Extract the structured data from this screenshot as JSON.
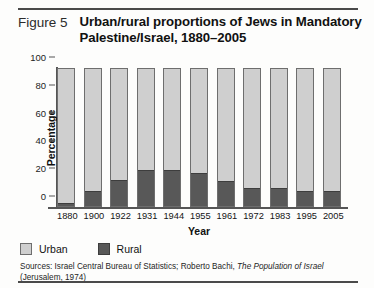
{
  "figure": {
    "label": "Figure 5",
    "title": "Urban/rural proportions of Jews in Mandatory Palestine/Israel, 1880–2005"
  },
  "legend": {
    "urban_label": "Urban",
    "rural_label": "Rural"
  },
  "sources": {
    "line1_pre": "Sources: Israel Central Bureau of Statistics; Roberto Bachi, ",
    "line1_italic": "The Population of Israel",
    "line2": "(Jerusalem, 1974)"
  },
  "colors": {
    "urban": "#cfcfcf",
    "rural": "#585858",
    "axis": "#555555",
    "rule": "#4a4a4a"
  },
  "chart_data": {
    "type": "bar",
    "stacked": true,
    "title": "Urban/rural proportions of Jews in Mandatory Palestine/Israel, 1880–2005",
    "xlabel": "Year",
    "ylabel": "Percentage",
    "ylim": [
      0,
      100
    ],
    "yticks": [
      0,
      20,
      40,
      60,
      80,
      100
    ],
    "ytick_labels": [
      "0",
      "20",
      "40",
      "60",
      "80",
      "100"
    ],
    "grid": false,
    "legend_position": "below-axis-left",
    "categories": [
      "1880",
      "1900",
      "1922",
      "1931",
      "1944",
      "1955",
      "1961",
      "1972",
      "1983",
      "1995",
      "2005"
    ],
    "series": [
      {
        "name": "Urban",
        "color": "#cfcfcf",
        "values": [
          98,
          89,
          81,
          74,
          74,
          76,
          82,
          87,
          87,
          89,
          89
        ]
      },
      {
        "name": "Rural",
        "color": "#585858",
        "values": [
          2,
          11,
          19,
          26,
          26,
          24,
          18,
          13,
          13,
          11,
          11
        ]
      }
    ]
  }
}
